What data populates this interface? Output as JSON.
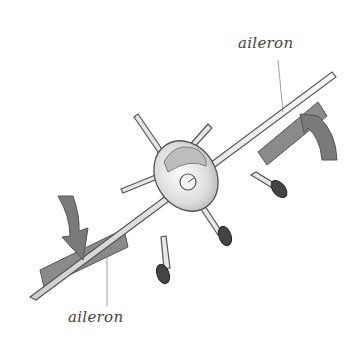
{
  "diagram": {
    "labels": {
      "top": "aileron",
      "bottom": "aileron"
    },
    "colors": {
      "aileron_fill": "#8a8a8a",
      "aileron_stroke": "#555555",
      "wing_fill": "#eeeeee",
      "outline": "#555555",
      "arrow_fill": "#7a7a7a",
      "tire": "#444444",
      "leader_line": "#888888"
    }
  }
}
